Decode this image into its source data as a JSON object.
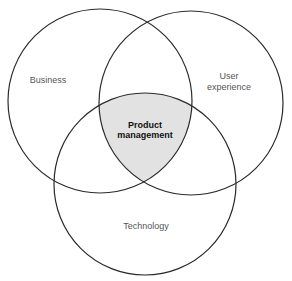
{
  "diagram": {
    "type": "venn",
    "circles": [
      {
        "id": "business",
        "label_lines": [
          "Business"
        ],
        "cx": 100,
        "cy": 101,
        "r": 92
      },
      {
        "id": "user-experience",
        "label_lines": [
          "User",
          "experience"
        ],
        "cx": 191,
        "cy": 103,
        "r": 92
      },
      {
        "id": "technology",
        "label_lines": [
          "Technology"
        ],
        "cx": 145,
        "cy": 184,
        "r": 91
      }
    ],
    "intersection": {
      "label_lines": [
        "Product",
        "management"
      ],
      "fill": "#e2e2e2"
    },
    "colors": {
      "stroke": "#2a2a2a",
      "label": "#555555",
      "center_label": "#111111"
    }
  }
}
